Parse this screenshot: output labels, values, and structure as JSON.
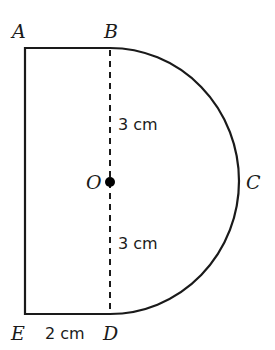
{
  "diagram": {
    "points": {
      "A": "A",
      "B": "B",
      "C": "C",
      "D": "D",
      "E": "E",
      "O": "O"
    },
    "dimensions": {
      "OB": "3 cm",
      "OD": "3 cm",
      "ED": "2 cm"
    },
    "colors": {
      "stroke": "#1a1a1a",
      "background": "#ffffff"
    }
  }
}
